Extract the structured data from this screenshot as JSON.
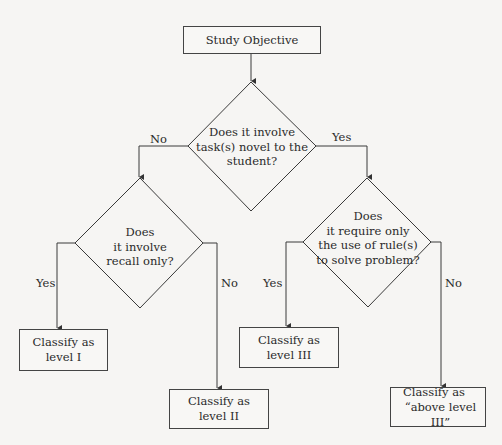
{
  "diagram": {
    "type": "decision-flowchart",
    "start": {
      "label": "Study Objective"
    },
    "decisions": [
      {
        "id": "novel",
        "lines": [
          "Does it involve",
          "task(s) novel to the",
          "student?"
        ],
        "no_label": "No",
        "yes_label": "Yes"
      },
      {
        "id": "recall",
        "lines": [
          "Does",
          "it involve",
          "recall only?"
        ],
        "yes_label": "Yes",
        "no_label": "No"
      },
      {
        "id": "rules",
        "lines": [
          "Does",
          "it require only",
          "the use of rule(s)",
          "to solve problem?"
        ],
        "yes_label": "Yes",
        "no_label": "No"
      }
    ],
    "outcomes": [
      {
        "id": "level1",
        "lines": [
          "Classify as",
          "level I"
        ]
      },
      {
        "id": "level2",
        "lines": [
          "Classify as",
          "level II"
        ]
      },
      {
        "id": "level3",
        "lines": [
          "Classify as",
          "level III"
        ]
      },
      {
        "id": "above3",
        "lines": [
          "Classify as",
          "“above level III”"
        ]
      }
    ],
    "edges": [
      {
        "from": "start",
        "to": "novel"
      },
      {
        "from": "novel",
        "to": "recall",
        "label": "No"
      },
      {
        "from": "novel",
        "to": "rules",
        "label": "Yes"
      },
      {
        "from": "recall",
        "to": "level1",
        "label": "Yes"
      },
      {
        "from": "recall",
        "to": "level2",
        "label": "No"
      },
      {
        "from": "rules",
        "to": "level3",
        "label": "Yes"
      },
      {
        "from": "rules",
        "to": "above3",
        "label": "No"
      }
    ],
    "colors": {
      "line": "#3a3a3a",
      "background": "#f6f5f3",
      "text": "#2a2a2a"
    }
  }
}
